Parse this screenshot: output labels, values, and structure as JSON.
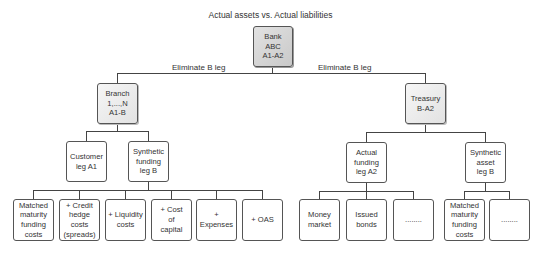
{
  "title": "Actual assets vs. Actual liabilities",
  "edge_labels": {
    "left": "Eliminate B leg",
    "right": "Eliminate B leg"
  },
  "nodes": {
    "root": "Bank\nABC\nA1-A2",
    "branch": "Branch\n1,...,N\nA1-B",
    "treasury": "Treasury\nB-A2",
    "customer_leg": "Customer\nleg A1",
    "synthetic_funding": "Synthetic\nfunding\nleg B",
    "actual_funding": "Actual\nfunding\nleg A2",
    "synthetic_asset": "Synthetic\nasset\nleg B",
    "matched_maturity_left": "Matched\nmaturity\nfunding\ncosts",
    "credit_hedge": "+ Credit\nhedge\ncosts\n(spreads)",
    "liquidity": "+ Liquidity\ncosts",
    "cost_of_capital": "+ Cost\nof\ncapital",
    "expenses": "+ Expenses",
    "oas": "+ OAS",
    "money_market": "Money\nmarket",
    "issued_bonds": "Issued\nbonds",
    "ellipsis_a2": "........",
    "matched_maturity_right": "Matched\nmaturity\nfunding\ncosts",
    "ellipsis_b": "........"
  },
  "colors": {
    "line": "#444444",
    "border": "#555555",
    "root_fill": "#d0d0d0",
    "mid_fill": "#ebebeb",
    "leaf_fill": "#ffffff"
  }
}
